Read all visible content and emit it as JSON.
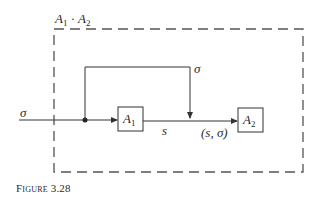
{
  "diagram": {
    "title": {
      "var": "A",
      "sub1": "1",
      "op": "·",
      "var2": "A",
      "sub2": "2"
    },
    "input_label": "σ",
    "feedback_label": "σ",
    "blocks": [
      {
        "id": "A1",
        "var": "A",
        "sub": "1"
      },
      {
        "id": "A2",
        "var": "A",
        "sub": "2"
      }
    ],
    "edge_label_s": "s",
    "edge_label_pair": "(s, σ)",
    "line_color": "#333333",
    "dash_color": "#555555"
  },
  "caption": "Figure 3.28"
}
